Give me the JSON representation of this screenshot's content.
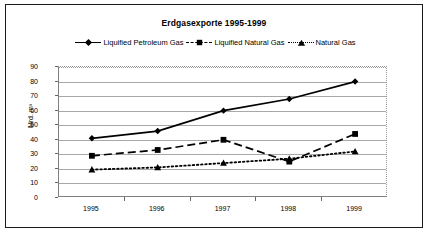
{
  "chart_data": {
    "type": "line",
    "title": "Erdgasexporte 1995-1999",
    "xlabel": "",
    "ylabel": "Mrd. m³",
    "categories": [
      "1995",
      "1996",
      "1997",
      "1998",
      "1999"
    ],
    "ylim": [
      0,
      90
    ],
    "ytick_values": [
      0,
      10,
      20,
      30,
      40,
      50,
      60,
      70,
      80,
      90
    ],
    "ytick_labels": [
      "0",
      "10",
      "20",
      "30",
      "40",
      "50",
      "60",
      "70",
      "80",
      "90"
    ],
    "grid": true,
    "legend_position": "top",
    "series": [
      {
        "name": "Liquified Petroleum Gas",
        "values": [
          41,
          46,
          60,
          68,
          80
        ],
        "marker": "diamond",
        "line_style": "solid",
        "color": "#000000"
      },
      {
        "name": "Liquified Natural Gas",
        "values": [
          29,
          33,
          40,
          25,
          44
        ],
        "marker": "square",
        "line_style": "dashed",
        "color": "#000000"
      },
      {
        "name": "Natural Gas",
        "values": [
          19.5,
          21,
          24,
          27,
          32
        ],
        "marker": "triangle",
        "line_style": "dotted",
        "color": "#000000"
      }
    ]
  },
  "colors": {
    "frame": "#1a1a1a",
    "grid": "#a8a8a8",
    "axis": "#808080",
    "ink": "#000000",
    "background": "#ffffff"
  }
}
